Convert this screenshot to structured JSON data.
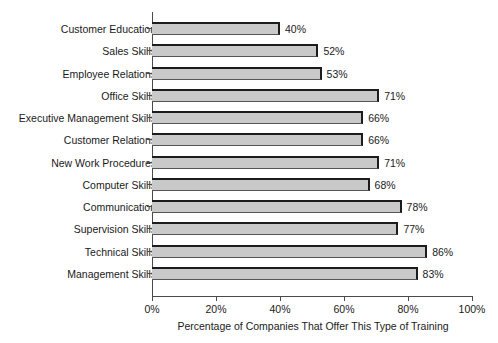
{
  "chart_data": {
    "type": "bar",
    "orientation": "horizontal",
    "title": "",
    "subtitle": "",
    "xlabel": "Percentage of Companies That Offer This Type of Training",
    "ylabel": "",
    "xlim": [
      0,
      100
    ],
    "grid": false,
    "legend": null,
    "x_tick_labels": [
      "0%",
      "20%",
      "40%",
      "60%",
      "80%",
      "100%"
    ],
    "x_tick_values": [
      0,
      20,
      40,
      60,
      80,
      100
    ],
    "categories": [
      "Customer Education",
      "Sales Skills",
      "Employee Relations",
      "Office Skills",
      "Executive Management Skills",
      "Customer Relations",
      "New Work Procedures",
      "Computer Skills",
      "Communication",
      "Supervision Skills",
      "Technical Skills",
      "Management Skills"
    ],
    "values": [
      40,
      52,
      53,
      71,
      66,
      66,
      71,
      68,
      78,
      77,
      86,
      83
    ],
    "value_labels": [
      "40%",
      "52%",
      "53%",
      "71%",
      "66%",
      "66%",
      "71%",
      "68%",
      "78%",
      "77%",
      "86%",
      "83%"
    ],
    "colors": {
      "bar_fill": "#c9c9c9",
      "bar_edge": "#1c1c1c",
      "axis": "#4a4a4a",
      "text": "#1a1a1a",
      "background": "#ffffff"
    }
  }
}
